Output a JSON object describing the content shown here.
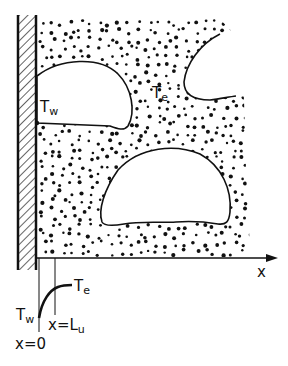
{
  "figure": {
    "colors": {
      "ink": "#111111",
      "background": "#ffffff"
    }
  },
  "labels": {
    "wall_temp": {
      "main": "T",
      "sub": "w"
    },
    "bulk_temp": {
      "main": "T",
      "sub": "e"
    },
    "axis_x": "x",
    "profile_wall_temp": {
      "main": "T",
      "sub": "w"
    },
    "profile_bulk_temp": {
      "main": "T",
      "sub": "e"
    },
    "x_origin": "x=0",
    "x_length": {
      "main": "x=L",
      "sub": "u"
    }
  },
  "elements": {
    "wall": "hatched heated wall",
    "liquid": "dotted liquid region",
    "bubbles": [
      "bubble attached to wall",
      "partial bubble upper right",
      "large bubble center"
    ],
    "profile": "temperature profile curve from T_w at x=0 to T_e at x=L_u"
  }
}
